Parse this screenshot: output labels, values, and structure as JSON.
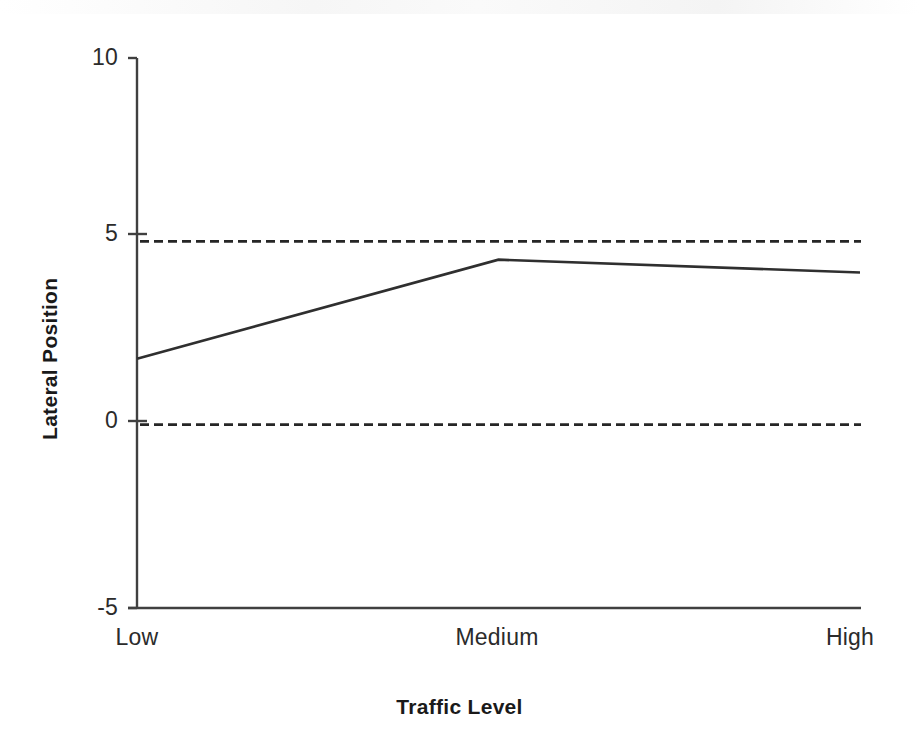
{
  "chart_data": {
    "type": "line",
    "title": "",
    "xlabel": "Traffic Level",
    "ylabel": "Lateral Position",
    "categories": [
      "Low",
      "Medium",
      "High"
    ],
    "series": [
      {
        "name": "Lateral Position",
        "values": [
          1.8,
          4.5,
          4.15
        ],
        "color": "#2f2f2f",
        "style": "solid"
      }
    ],
    "ylim": [
      -5,
      10
    ],
    "yticks": [
      10,
      5,
      0,
      -5
    ],
    "ytick_labels": [
      "10",
      "5",
      "0",
      "-5"
    ],
    "xtick_labels": [
      "Low",
      "Medium",
      "High"
    ],
    "grid": false,
    "legend": "none",
    "reference_lines": [
      {
        "value": 5,
        "style": "dashed",
        "color": "#262626"
      },
      {
        "value": 0,
        "style": "dashed",
        "color": "#262626"
      }
    ],
    "axis_color": "#404040",
    "background": "#ffffff"
  }
}
